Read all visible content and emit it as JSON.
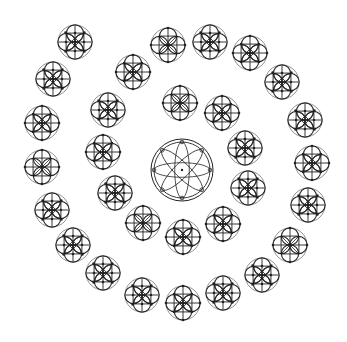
{
  "diagram": {
    "title": "",
    "background": "#ffffff",
    "stroke_dark": "#222222",
    "stroke_light": "#777777",
    "center_rosette": {
      "cx": 182,
      "cy": 170,
      "r_outer": 31,
      "r_inner": 28,
      "petals": 8
    },
    "motif_radius": 17,
    "inner_ring": [
      {
        "cx": 180,
        "cy": 103,
        "variant": "a"
      },
      {
        "cx": 222,
        "cy": 113,
        "variant": "b"
      },
      {
        "cx": 245,
        "cy": 148,
        "variant": "c"
      },
      {
        "cx": 248,
        "cy": 188,
        "variant": "c"
      },
      {
        "cx": 223,
        "cy": 224,
        "variant": "b"
      },
      {
        "cx": 183,
        "cy": 237,
        "variant": "b"
      },
      {
        "cx": 143,
        "cy": 223,
        "variant": "a"
      },
      {
        "cx": 115,
        "cy": 193,
        "variant": "c"
      },
      {
        "cx": 103,
        "cy": 152,
        "variant": "b"
      },
      {
        "cx": 108,
        "cy": 110,
        "variant": "c"
      },
      {
        "cx": 133,
        "cy": 72,
        "variant": "b"
      }
    ],
    "outer_ring": [
      {
        "cx": 168,
        "cy": 45,
        "variant": "a"
      },
      {
        "cx": 210,
        "cy": 42,
        "variant": "c"
      },
      {
        "cx": 250,
        "cy": 53,
        "variant": "b"
      },
      {
        "cx": 282,
        "cy": 82,
        "variant": "c"
      },
      {
        "cx": 305,
        "cy": 120,
        "variant": "c"
      },
      {
        "cx": 312,
        "cy": 163,
        "variant": "b"
      },
      {
        "cx": 308,
        "cy": 205,
        "variant": "c"
      },
      {
        "cx": 290,
        "cy": 245,
        "variant": "a"
      },
      {
        "cx": 262,
        "cy": 275,
        "variant": "c"
      },
      {
        "cx": 223,
        "cy": 293,
        "variant": "c"
      },
      {
        "cx": 183,
        "cy": 303,
        "variant": "b"
      },
      {
        "cx": 142,
        "cy": 295,
        "variant": "c"
      },
      {
        "cx": 103,
        "cy": 273,
        "variant": "c"
      },
      {
        "cx": 73,
        "cy": 245,
        "variant": "c"
      },
      {
        "cx": 52,
        "cy": 210,
        "variant": "c"
      },
      {
        "cx": 42,
        "cy": 167,
        "variant": "a"
      },
      {
        "cx": 42,
        "cy": 123,
        "variant": "b"
      },
      {
        "cx": 53,
        "cy": 79,
        "variant": "c"
      },
      {
        "cx": 75,
        "cy": 42,
        "variant": "c"
      }
    ]
  }
}
